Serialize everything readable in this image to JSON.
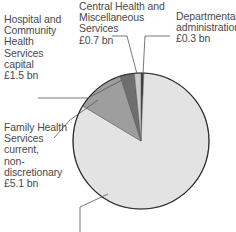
{
  "chart_data": {
    "type": "pie",
    "title": "",
    "unit": "£ bn",
    "slices": [
      {
        "name": "Departmental administration",
        "label_lines": [
          "Departmental",
          "administration",
          "£0.3 bn"
        ],
        "value": 0.3,
        "color": "#3a3a3a"
      },
      {
        "name": "Central Health and Miscellaneous Services",
        "label_lines": [
          "Central Health and",
          "Miscellaneous",
          "Services",
          "£0.7 bn"
        ],
        "value": 0.7,
        "color": "#c9c9c9"
      },
      {
        "name": "Hospital and Community Health Services capital",
        "label_lines": [
          "Hospital and",
          "Community",
          "Health",
          "Services",
          "capital",
          "£1.5 bn"
        ],
        "value": 1.5,
        "color": "#6e6e6e"
      },
      {
        "name": "Family Health Services current, non-discretionary",
        "label_lines": [
          "Family Health",
          "Services",
          "current,",
          "non-",
          "discretionary",
          "£5.1 bn"
        ],
        "value": 5.1,
        "color": "#9e9e9e"
      },
      {
        "name": "Remaining (label cut off below image)",
        "label_lines": [],
        "value": 37.0,
        "color": "#e3e3e3"
      }
    ],
    "legend": "none (direct labels with leader lines)"
  }
}
